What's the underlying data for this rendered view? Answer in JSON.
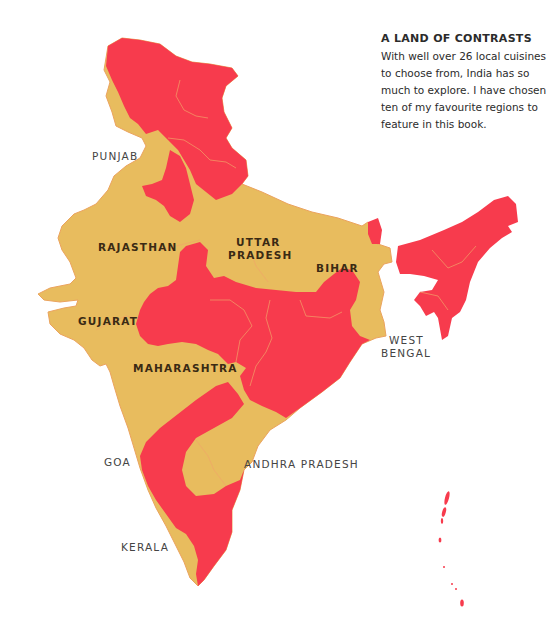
{
  "colors": {
    "featured_region": "#F73B4D",
    "other_region": "#E8BC5E",
    "border_line": "#F2A66A",
    "background": "#FFFFFF",
    "label_inside": "#3A2A14",
    "label_outside": "#444444"
  },
  "info_box": {
    "title": "A LAND OF CONTRASTS",
    "body": "With well over 26 local cuisines to choose from, India has so much to explore. I have chosen ten of my favourite regions to feature in this book."
  },
  "labels": {
    "punjab": "PUNJAB",
    "rajasthan": "RAJASTHAN",
    "uttar_pradesh_1": "UTTAR",
    "uttar_pradesh_2": "PRADESH",
    "bihar": "BIHAR",
    "gujarat": "GUJARAT",
    "west_bengal_1": "WEST",
    "west_bengal_2": "BENGAL",
    "maharashtra": "MAHARASHTRA",
    "goa": "GOA",
    "andhra_pradesh": "ANDHRA PRADESH",
    "kerala": "KERALA"
  },
  "legend_meaning": {
    "yellow": "Featured regions (ten favourites)",
    "red": "Other regions"
  }
}
